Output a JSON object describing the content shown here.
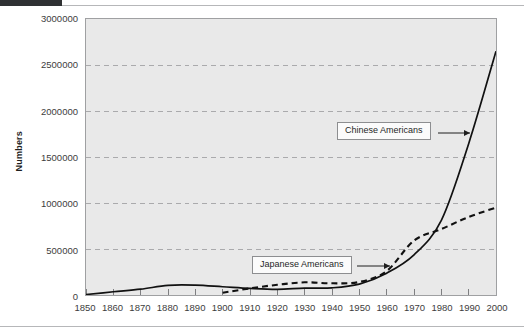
{
  "figure": {
    "plot_background": "#e9e9e9",
    "frame_color": "#9fa0a2",
    "gridline_color": "#a9a9ab",
    "series_color": "#111111"
  },
  "annotations": [
    {
      "id": "chinese",
      "label": "Chinese Americans"
    },
    {
      "id": "japanese",
      "label": "Japanese Americans"
    }
  ],
  "chart_data": {
    "type": "line",
    "title": "",
    "xlabel": "",
    "ylabel": "Numbers",
    "xlim": [
      1850,
      2000
    ],
    "ylim": [
      0,
      3000000
    ],
    "grid": true,
    "grid_axis": "y",
    "legend": "annotations-inline",
    "x": [
      1850,
      1860,
      1870,
      1880,
      1890,
      1900,
      1910,
      1920,
      1930,
      1940,
      1950,
      1960,
      1970,
      1980,
      1990,
      2000
    ],
    "xticklabels": [
      "1850",
      "1860",
      "1870",
      "1880",
      "1890",
      "1900",
      "1910",
      "1920",
      "1930",
      "1940",
      "1950",
      "1960",
      "1970",
      "1980",
      "1990",
      "2000"
    ],
    "yticks": [
      0,
      500000,
      1000000,
      1500000,
      2000000,
      2500000,
      3000000
    ],
    "yticklabels": [
      "0",
      "500000",
      "1000000",
      "1500000",
      "2000000",
      "2500000",
      "3000000"
    ],
    "series": [
      {
        "name": "Chinese Americans",
        "style": "solid",
        "values": [
          5000,
          35000,
          63000,
          105000,
          107000,
          90000,
          72000,
          62000,
          75000,
          78000,
          118000,
          237000,
          436000,
          812000,
          1645000,
          2650000
        ]
      },
      {
        "name": "Japanese Americans",
        "style": "dashed",
        "values": [
          null,
          null,
          null,
          null,
          null,
          24000,
          72000,
          111000,
          138000,
          127000,
          142000,
          260000,
          591000,
          716000,
          848000,
          950000
        ]
      }
    ]
  }
}
